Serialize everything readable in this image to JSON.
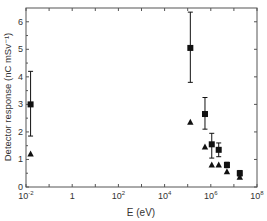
{
  "chart_data": {
    "type": "scatter",
    "title": "",
    "xlabel": "E (eV)",
    "ylabel": "Detector response (nC mSv⁻¹)",
    "xscale": "log",
    "xlim": [
      0.01,
      100000000
    ],
    "ylim": [
      0,
      6.5
    ],
    "x_ticks": [
      {
        "exp": -2,
        "label": "10",
        "sup": "-2"
      },
      {
        "exp": 0,
        "label": "1",
        "sup": ""
      },
      {
        "exp": 2,
        "label": "10",
        "sup": "2"
      },
      {
        "exp": 4,
        "label": "10",
        "sup": "4"
      },
      {
        "exp": 6,
        "label": "10",
        "sup": "6"
      },
      {
        "exp": 8,
        "label": "10",
        "sup": "8"
      }
    ],
    "y_ticks": [
      0,
      1,
      2,
      3,
      4,
      5,
      6
    ],
    "grid": false,
    "legend": null,
    "series": [
      {
        "name": "squares",
        "marker": "square",
        "x": [
          0.0158,
          130000,
          560000,
          1100000,
          2200000,
          5000000,
          18000000
        ],
        "values": [
          3.0,
          5.05,
          2.65,
          1.55,
          1.35,
          0.8,
          0.5
        ],
        "err_low": [
          1.85,
          3.8,
          2.1,
          1.05,
          1.1,
          0.7,
          0.4
        ],
        "err_high": [
          4.2,
          6.35,
          3.25,
          1.95,
          1.6,
          0.9,
          0.6
        ]
      },
      {
        "name": "triangles",
        "marker": "triangle",
        "x": [
          0.0158,
          130000,
          560000,
          1100000,
          2200000,
          5000000,
          18000000
        ],
        "values": [
          1.2,
          2.35,
          1.45,
          0.8,
          0.8,
          0.55,
          0.35
        ]
      }
    ],
    "colors": {
      "marker": "#111111",
      "axis": "#555555",
      "text": "#333333"
    }
  }
}
